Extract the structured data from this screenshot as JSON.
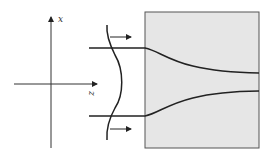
{
  "diagram": {
    "axes": {
      "vertical_label": "x",
      "horizontal_label": "z"
    },
    "medium_box": {
      "fill": "#e6e6e6",
      "stroke": "#555555"
    },
    "curve_color": "#222222"
  }
}
